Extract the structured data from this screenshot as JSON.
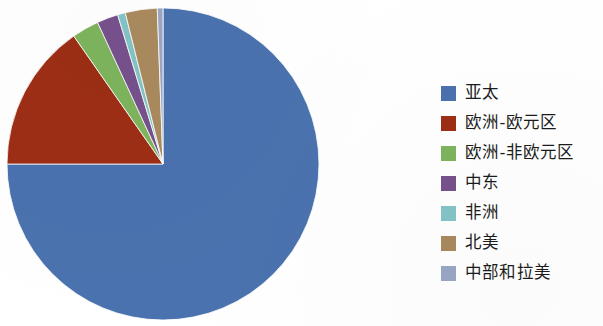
{
  "chart_data": {
    "type": "pie",
    "title": "",
    "subtitle": "",
    "xlabel": "",
    "ylabel": "",
    "legend_position": "right",
    "grid": false,
    "start_angle_deg": 0,
    "direction": "clockwise",
    "categories": [
      "亚太",
      "欧洲-欧元区",
      "欧洲-非欧元区",
      "中东",
      "非洲",
      "北美",
      "中部和拉美"
    ],
    "values": [
      75.0,
      15.3,
      2.8,
      2.2,
      0.8,
      3.3,
      0.6
    ],
    "colors": [
      "#4a72ae",
      "#9c2e15",
      "#7db45c",
      "#77518c",
      "#83c4c6",
      "#a98a5e",
      "#9aa7c4"
    ],
    "series": [
      {
        "name": "区域占比",
        "values": [
          75.0,
          15.3,
          2.8,
          2.2,
          0.8,
          3.3,
          0.6
        ]
      }
    ],
    "slices": [
      {
        "label": "亚太",
        "value": 75.0,
        "color": "#4a72ae",
        "start_deg": 0.0,
        "end_deg": 270.0
      },
      {
        "label": "欧洲-欧元区",
        "value": 15.3,
        "color": "#9c2e15",
        "start_deg": 270.0,
        "end_deg": 325.1
      },
      {
        "label": "欧洲-非欧元区",
        "value": 2.8,
        "color": "#7db45c",
        "start_deg": 325.1,
        "end_deg": 335.2
      },
      {
        "label": "中东",
        "value": 2.2,
        "color": "#77518c",
        "start_deg": 335.2,
        "end_deg": 343.1
      },
      {
        "label": "非洲",
        "value": 0.8,
        "color": "#83c4c6",
        "start_deg": 343.1,
        "end_deg": 346.0
      },
      {
        "label": "北美",
        "value": 3.3,
        "color": "#a98a5e",
        "start_deg": 346.0,
        "end_deg": 357.9
      },
      {
        "label": "中部和拉美",
        "value": 0.6,
        "color": "#9aa7c4",
        "start_deg": 357.9,
        "end_deg": 360.0
      }
    ],
    "geometry": {
      "center_x": 163,
      "center_y": 164,
      "radius": 156
    }
  },
  "legend": {
    "items": [
      {
        "label": "亚太",
        "color": "#4a72ae"
      },
      {
        "label": "欧洲-欧元区",
        "color": "#9c2e15"
      },
      {
        "label": "欧洲-非欧元区",
        "color": "#7db45c"
      },
      {
        "label": "中东",
        "color": "#77518c"
      },
      {
        "label": "非洲",
        "color": "#83c4c6"
      },
      {
        "label": "北美",
        "color": "#a98a5e"
      },
      {
        "label": "中部和拉美",
        "color": "#9aa7c4"
      }
    ]
  }
}
